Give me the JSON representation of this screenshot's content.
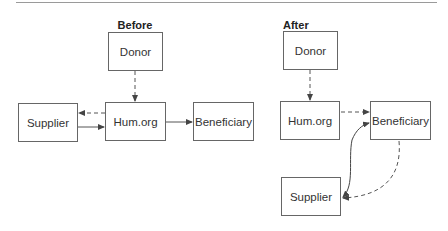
{
  "panels": {
    "before": {
      "title": "Before",
      "nodes": {
        "donor": "Donor",
        "supplier": "Supplier",
        "humorg": "Hum.org",
        "beneficiary": "Beneficiary"
      },
      "edges": [
        {
          "from": "Donor",
          "to": "Hum.org",
          "style": "dashed"
        },
        {
          "from": "Hum.org",
          "to": "Supplier",
          "style": "dashed"
        },
        {
          "from": "Supplier",
          "to": "Hum.org",
          "style": "solid"
        },
        {
          "from": "Hum.org",
          "to": "Beneficiary",
          "style": "solid"
        }
      ]
    },
    "after": {
      "title": "After",
      "nodes": {
        "donor": "Donor",
        "humorg": "Hum.org",
        "beneficiary": "Beneficiary",
        "supplier": "Supplier"
      },
      "edges": [
        {
          "from": "Donor",
          "to": "Hum.org",
          "style": "dashed"
        },
        {
          "from": "Hum.org",
          "to": "Beneficiary",
          "style": "dashed"
        },
        {
          "from": "Beneficiary",
          "to": "Supplier",
          "style": "dashed"
        },
        {
          "from": "Supplier",
          "to": "Beneficiary",
          "style": "solid",
          "bidirectional": true
        }
      ]
    }
  },
  "colors": {
    "line": "#555555",
    "border": "#666666",
    "text": "#333333"
  }
}
